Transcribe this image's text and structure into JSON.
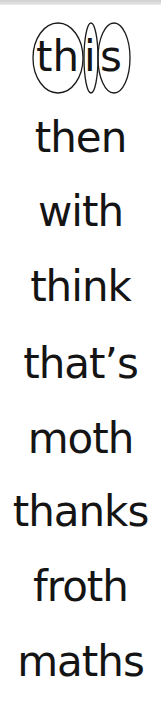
{
  "worksheet": {
    "segmented_word": {
      "full": "this",
      "segments": [
        "th",
        "i",
        "s"
      ]
    },
    "words": [
      "then",
      "with",
      "think",
      "that’s",
      "moth",
      "thanks",
      "froth",
      "maths"
    ]
  },
  "colors": {
    "text": "#141414",
    "oval_stroke": "#1a1a1a",
    "background": "#ffffff"
  }
}
